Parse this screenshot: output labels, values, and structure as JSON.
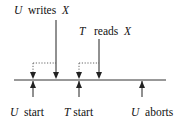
{
  "diagram": {
    "labels": {
      "u_writes": {
        "actor": "U",
        "action": "writes",
        "object": "X"
      },
      "t_reads": {
        "actor": "T",
        "action": "reads",
        "object": "X"
      },
      "u_start": {
        "actor": "U",
        "action": "start"
      },
      "t_start": {
        "actor": "T",
        "action": "start"
      },
      "u_aborts": {
        "actor": "U",
        "action": "aborts"
      }
    },
    "colors": {
      "line": "#222222",
      "dotted": "#555555"
    }
  }
}
